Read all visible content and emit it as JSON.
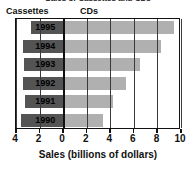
{
  "chart_data": {
    "type": "bar",
    "orientation": "horizontal",
    "style": "bidirectional-pyramid",
    "title": "Sales of Cassettes and CDs",
    "xlabel": "Sales (billions of dollars)",
    "ylabel": "",
    "categories": [
      "1995",
      "1994",
      "1993",
      "1992",
      "1991",
      "1990"
    ],
    "series": [
      {
        "name": "Cassettes",
        "direction": "left",
        "color": "#545454",
        "values": [
          2.7,
          3.4,
          3.3,
          3.4,
          3.2,
          3.6
        ]
      },
      {
        "name": "CDs",
        "direction": "right",
        "color": "#b0b0b0",
        "values": [
          9.4,
          8.3,
          6.5,
          5.3,
          4.2,
          3.4
        ]
      }
    ],
    "left_axis_max": 4,
    "right_axis_max": 10,
    "xticks": [
      "4",
      "2",
      "0",
      "2",
      "4",
      "6",
      "8",
      "10"
    ],
    "xtick_values": [
      -4,
      -2,
      0,
      2,
      4,
      6,
      8,
      10
    ],
    "grid": true,
    "legend_position": "top-left"
  },
  "legend": {
    "cassettes": "Cassettes",
    "cds": "CDs"
  }
}
